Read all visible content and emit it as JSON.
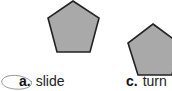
{
  "options": [
    {
      "letter": "a.",
      "text": "slide",
      "circled": true
    },
    {
      "letter": "c.",
      "text": "turn",
      "circled": false
    }
  ],
  "shapes": [
    {
      "type": "pentagon",
      "fill": "#a9a9a9",
      "stroke": "#222222"
    },
    {
      "type": "pentagon",
      "fill": "#a9a9a9",
      "stroke": "#222222"
    }
  ]
}
